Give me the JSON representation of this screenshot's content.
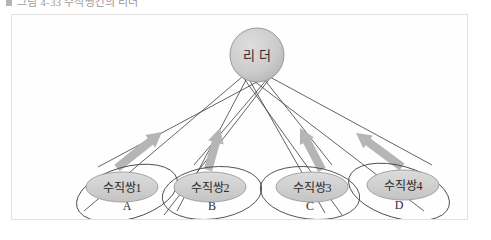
{
  "caption": {
    "bullet_icon": "square-bullet-icon",
    "text": "그림 4-33  수직쌍간의 리더"
  },
  "diagram": {
    "type": "node-link-diagram",
    "colors": {
      "node_fill": "#cfcfcf",
      "node_stroke": "#9a9a9a",
      "outer_stroke": "#4a4a4a",
      "link_stroke": "#3c3c3c",
      "arrow_fill": "#b5b5b5",
      "frame_border": "#e2e2e2",
      "background": "#fefefe"
    },
    "leader": {
      "id": "leader",
      "label": "리 더",
      "shape": "circle",
      "cx": 245,
      "cy": 40,
      "r": 27
    },
    "groups": [
      {
        "id": "group-a",
        "inner_label": "수직쌍1",
        "outer_label": "A",
        "inner": {
          "cx": 110,
          "cy": 172,
          "rx": 36,
          "ry": 15
        },
        "outer": {
          "cx": 115,
          "cy": 178,
          "rx": 52,
          "ry": 26,
          "rotate": -16
        },
        "arrow": {
          "x1": 105,
          "y1": 153,
          "x2": 150,
          "y2": 117
        }
      },
      {
        "id": "group-b",
        "inner_label": "수직쌍2",
        "outer_label": "B",
        "inner": {
          "cx": 198,
          "cy": 172,
          "rx": 36,
          "ry": 15
        },
        "outer": {
          "cx": 200,
          "cy": 178,
          "rx": 50,
          "ry": 26,
          "rotate": -7
        },
        "arrow": {
          "x1": 196,
          "y1": 155,
          "x2": 208,
          "y2": 113
        }
      },
      {
        "id": "group-c",
        "inner_label": "수직쌍3",
        "outer_label": "C",
        "inner": {
          "cx": 300,
          "cy": 172,
          "rx": 36,
          "ry": 15
        },
        "outer": {
          "cx": 298,
          "cy": 178,
          "rx": 50,
          "ry": 26,
          "rotate": 7
        },
        "arrow": {
          "x1": 310,
          "y1": 155,
          "x2": 288,
          "y2": 113
        }
      },
      {
        "id": "group-d",
        "inner_label": "수직쌍4",
        "outer_label": "D",
        "inner": {
          "cx": 391,
          "cy": 170,
          "rx": 36,
          "ry": 15
        },
        "outer": {
          "cx": 387,
          "cy": 177,
          "rx": 52,
          "ry": 26,
          "rotate": 16
        },
        "arrow": {
          "x1": 390,
          "y1": 152,
          "x2": 344,
          "y2": 118
        }
      }
    ],
    "links": [
      {
        "from": "leader",
        "to": "group-a",
        "x1": 230,
        "y1": 62,
        "x2": 72,
        "y2": 196
      },
      {
        "from": "leader",
        "to": "group-a",
        "x1": 258,
        "y1": 60,
        "x2": 86,
        "y2": 152
      },
      {
        "from": "leader",
        "to": "group-b",
        "x1": 234,
        "y1": 65,
        "x2": 165,
        "y2": 196
      },
      {
        "from": "leader",
        "to": "group-b",
        "x1": 256,
        "y1": 63,
        "x2": 182,
        "y2": 150
      },
      {
        "from": "leader",
        "to": "group-c",
        "x1": 238,
        "y1": 66,
        "x2": 313,
        "y2": 198
      },
      {
        "from": "leader",
        "to": "group-c",
        "x1": 252,
        "y1": 64,
        "x2": 320,
        "y2": 150
      },
      {
        "from": "leader",
        "to": "group-d",
        "x1": 242,
        "y1": 66,
        "x2": 412,
        "y2": 196
      },
      {
        "from": "leader",
        "to": "group-d",
        "x1": 258,
        "y1": 62,
        "x2": 420,
        "y2": 150
      },
      {
        "from": "leader",
        "to": "cross-1",
        "x1": 228,
        "y1": 58,
        "x2": 330,
        "y2": 200
      },
      {
        "from": "leader",
        "to": "cross-2",
        "x1": 262,
        "y1": 58,
        "x2": 152,
        "y2": 200
      }
    ]
  }
}
